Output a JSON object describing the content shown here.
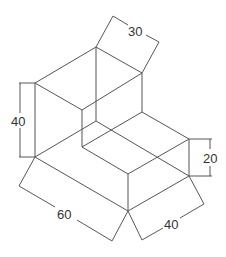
{
  "diagram": {
    "type": "isometric-drawing",
    "line_color": "#555555",
    "background": "#ffffff",
    "dimensions": [
      {
        "id": "top-depth",
        "label": "30",
        "position": "top"
      },
      {
        "id": "height",
        "label": "40",
        "position": "left"
      },
      {
        "id": "step-height",
        "label": "20",
        "position": "right"
      },
      {
        "id": "length",
        "label": "60",
        "position": "bottom-left"
      },
      {
        "id": "width",
        "label": "40",
        "position": "bottom-right"
      }
    ]
  }
}
